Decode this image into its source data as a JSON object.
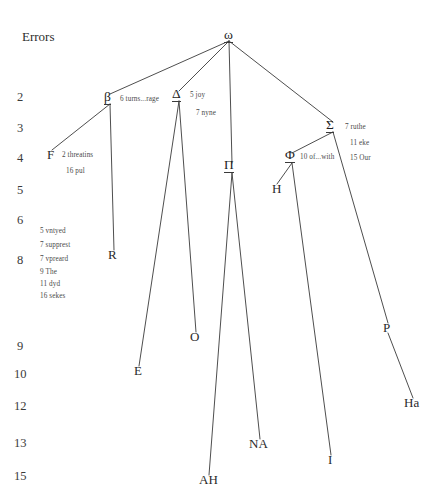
{
  "diagram": {
    "title": "Errors",
    "type": "stemma-codicum",
    "scale_label": "Errors",
    "error_scale": [
      {
        "value": "2",
        "x": 17,
        "y": 91
      },
      {
        "value": "3",
        "x": 17,
        "y": 122
      },
      {
        "value": "4",
        "x": 17,
        "y": 152
      },
      {
        "value": "5",
        "x": 17,
        "y": 184
      },
      {
        "value": "6",
        "x": 17,
        "y": 214
      },
      {
        "value": "8",
        "x": 17,
        "y": 254
      },
      {
        "value": "9",
        "x": 17,
        "y": 340
      },
      {
        "value": "10",
        "x": 14,
        "y": 368
      },
      {
        "value": "12",
        "x": 14,
        "y": 400
      },
      {
        "value": "13",
        "x": 14,
        "y": 437
      },
      {
        "value": "15",
        "x": 14,
        "y": 470
      }
    ],
    "nodes": [
      {
        "id": "omega",
        "label": "ω",
        "kind": "archetype",
        "x": 224,
        "y": 28,
        "cx": 229,
        "cy": 37
      },
      {
        "id": "beta",
        "label": "β",
        "kind": "hyparchetype",
        "x": 104,
        "y": 90,
        "cx": 110,
        "cy": 100
      },
      {
        "id": "delta",
        "label": "Δ",
        "kind": "hyparchetype",
        "x": 172,
        "y": 87,
        "cx": 179,
        "cy": 97
      },
      {
        "id": "pi",
        "label": "Π",
        "kind": "hyparchetype",
        "x": 224,
        "y": 158,
        "cx": 232,
        "cy": 169
      },
      {
        "id": "sigma",
        "label": "Σ",
        "kind": "hyparchetype",
        "x": 326,
        "y": 118,
        "cx": 333,
        "cy": 128
      },
      {
        "id": "phi",
        "label": "Φ",
        "kind": "hyparchetype",
        "x": 285,
        "y": 148,
        "cx": 292,
        "cy": 159
      },
      {
        "id": "F",
        "label": "F",
        "kind": "manuscript",
        "x": 47,
        "y": 148,
        "cx": 52,
        "cy": 156
      },
      {
        "id": "R",
        "label": "R",
        "kind": "manuscript",
        "x": 108,
        "y": 248,
        "cx": 114,
        "cy": 256
      },
      {
        "id": "E",
        "label": "E",
        "kind": "manuscript",
        "x": 134,
        "y": 364,
        "cx": 139,
        "cy": 372
      },
      {
        "id": "O",
        "label": "O",
        "kind": "manuscript",
        "x": 190,
        "y": 330,
        "cx": 196,
        "cy": 338
      },
      {
        "id": "AH",
        "label": "AH",
        "kind": "manuscript",
        "x": 199,
        "y": 473,
        "cx": 209,
        "cy": 481
      },
      {
        "id": "NA",
        "label": "NA",
        "kind": "manuscript",
        "x": 249,
        "y": 437,
        "cx": 260,
        "cy": 445
      },
      {
        "id": "H",
        "label": "H",
        "kind": "manuscript",
        "x": 272,
        "y": 182,
        "cx": 277,
        "cy": 190
      },
      {
        "id": "I",
        "label": "I",
        "kind": "manuscript",
        "x": 328,
        "y": 453,
        "cx": 331,
        "cy": 461
      },
      {
        "id": "P",
        "label": "P",
        "kind": "manuscript",
        "x": 383,
        "y": 321,
        "cx": 388,
        "cy": 329
      },
      {
        "id": "Ha",
        "label": "Ha",
        "kind": "manuscript",
        "x": 404,
        "y": 396,
        "cx": 413,
        "cy": 404
      }
    ],
    "edges": [
      {
        "from": "omega",
        "to": "beta"
      },
      {
        "from": "omega",
        "to": "delta"
      },
      {
        "from": "omega",
        "to": "pi"
      },
      {
        "from": "omega",
        "to": "sigma"
      },
      {
        "from": "beta",
        "to": "F"
      },
      {
        "from": "beta",
        "to": "R"
      },
      {
        "from": "delta",
        "to": "E"
      },
      {
        "from": "delta",
        "to": "O"
      },
      {
        "from": "pi",
        "to": "AH"
      },
      {
        "from": "pi",
        "to": "NA"
      },
      {
        "from": "sigma",
        "to": "phi"
      },
      {
        "from": "sigma",
        "to": "P"
      },
      {
        "from": "phi",
        "to": "H"
      },
      {
        "from": "phi",
        "to": "I"
      },
      {
        "from": "P",
        "to": "Ha"
      }
    ],
    "variant_notes": [
      {
        "id": "beta-note",
        "text": "6 turns...rage",
        "x": 120,
        "y": 96,
        "align": "left"
      },
      {
        "id": "delta-note1",
        "text": "5 joy",
        "x": 190,
        "y": 92,
        "align": "left"
      },
      {
        "id": "delta-note2",
        "text": "7 nyne",
        "x": 196,
        "y": 110,
        "align": "left"
      },
      {
        "id": "sigma-note1",
        "text": "7 ruthe",
        "x": 345,
        "y": 124,
        "align": "left"
      },
      {
        "id": "sigma-note2",
        "text": "11 eke",
        "x": 350,
        "y": 140,
        "align": "left"
      },
      {
        "id": "sigma-note3",
        "text": "15 Our",
        "x": 350,
        "y": 155,
        "align": "left"
      },
      {
        "id": "phi-note",
        "text": "10 of...with",
        "x": 300,
        "y": 154,
        "align": "left"
      },
      {
        "id": "f-note1",
        "text": "2 threatins",
        "x": 62,
        "y": 152,
        "align": "left"
      },
      {
        "id": "f-note2",
        "text": "16 pul",
        "x": 66,
        "y": 168,
        "align": "left"
      },
      {
        "id": "beta-lower1",
        "text": "5 vntyed",
        "x": 40,
        "y": 228,
        "align": "left"
      },
      {
        "id": "beta-lower2",
        "text": "7 supprest",
        "x": 40,
        "y": 242,
        "align": "left"
      },
      {
        "id": "beta-lower3",
        "text": "7 vpreard",
        "x": 40,
        "y": 256,
        "align": "left"
      },
      {
        "id": "beta-lower4",
        "text": "9 The",
        "x": 40,
        "y": 269,
        "align": "left"
      },
      {
        "id": "beta-lower5",
        "text": "11 dyd",
        "x": 40,
        "y": 281,
        "align": "left"
      },
      {
        "id": "beta-lower6",
        "text": "16 sekes",
        "x": 40,
        "y": 293,
        "align": "left"
      }
    ],
    "colors": {
      "line": "#3a3a3a",
      "text": "#2b2b2b",
      "background": "#ffffff"
    }
  }
}
